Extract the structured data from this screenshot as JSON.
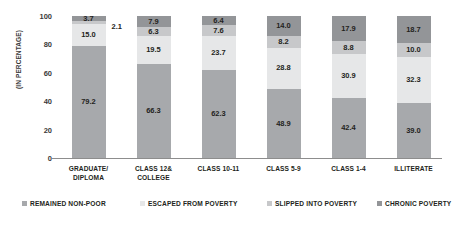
{
  "chart_data": {
    "type": "bar",
    "subtype": "stacked-bar-100",
    "title": "",
    "xlabel": "",
    "ylabel": "(IN PERCENTAGE)",
    "ylim": [
      0,
      100
    ],
    "yticks": [
      0,
      20,
      40,
      60,
      80,
      100
    ],
    "grid": false,
    "legend_position": "bottom",
    "categories": [
      "GRADUATE/\nDIPLOMA",
      "CLASS 12&\nCOLLEGE",
      "CLASS 10-11",
      "CLASS 5-9",
      "CLASS 1-4",
      "ILLITERATE"
    ],
    "category_lines": [
      [
        "GRADUATE/",
        "DIPLOMA"
      ],
      [
        "CLASS 12&",
        "COLLEGE"
      ],
      [
        "CLASS 10-11",
        ""
      ],
      [
        "CLASS 5-9",
        ""
      ],
      [
        "CLASS 1-4",
        ""
      ],
      [
        "ILLITERATE",
        ""
      ]
    ],
    "series": [
      {
        "name": "REMAINED NON-POOR",
        "color": "#a7a9ac",
        "values": [
          79.2,
          66.3,
          62.3,
          48.9,
          42.4,
          39.0
        ],
        "labels": [
          "79.2",
          "66.3",
          "62.3",
          "48.9",
          "42.4",
          "39.0"
        ]
      },
      {
        "name": "ESCAPED FROM POVERTY",
        "color": "#e6e7e8",
        "values": [
          15.0,
          19.5,
          23.7,
          28.8,
          30.9,
          32.3
        ],
        "labels": [
          "15.0",
          "19.5",
          "23.7",
          "28.8",
          "30.9",
          "32.3"
        ]
      },
      {
        "name": "SLIPPED INTO POVERTY",
        "color": "#c7c8ca",
        "values": [
          2.1,
          6.3,
          7.6,
          8.2,
          8.8,
          10.0
        ],
        "labels": [
          "2.1",
          "6.3",
          "7.6",
          "8.2",
          "8.8",
          "10.0"
        ],
        "label_outside": [
          true,
          false,
          false,
          false,
          false,
          false
        ]
      },
      {
        "name": "CHRONIC POVERTY",
        "color": "#939598",
        "values": [
          3.7,
          7.9,
          6.4,
          14.0,
          17.9,
          18.7
        ],
        "labels": [
          "3.7",
          "7.9",
          "6.4",
          "14.0",
          "17.9",
          "18.7"
        ]
      }
    ],
    "legend": [
      {
        "label": "REMAINED NON-POOR",
        "color": "#a7a9ac"
      },
      {
        "label": "ESCAPED FROM POVERTY",
        "color": "#e6e7e8"
      },
      {
        "label": "SLIPPED INTO POVERTY",
        "color": "#c7c8ca"
      },
      {
        "label": "CHRONIC POVERTY",
        "color": "#939598"
      }
    ],
    "axis_color": "#8d8d8d",
    "text_color": "#231f20",
    "background": "#ffffff"
  }
}
